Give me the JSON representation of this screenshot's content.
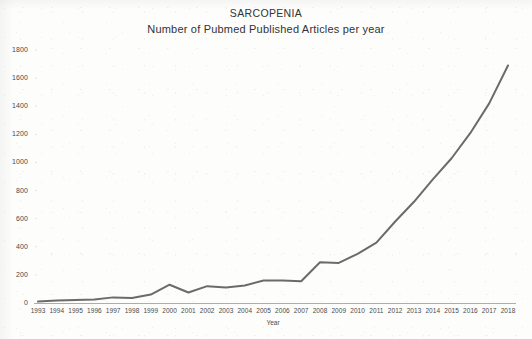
{
  "chart_data": {
    "type": "line",
    "title": "SARCOPENIA",
    "subtitle": "Number of Pubmed Published Articles per year",
    "xlabel": "Year",
    "ylabel": "",
    "categories": [
      "1993",
      "1994",
      "1995",
      "1996",
      "1997",
      "1998",
      "1999",
      "2000",
      "2001",
      "2002",
      "2003",
      "2004",
      "2005",
      "2006",
      "2007",
      "2008",
      "2009",
      "2010",
      "2011",
      "2012",
      "2013",
      "2014",
      "2015",
      "2016",
      "2017",
      "2018"
    ],
    "values": [
      10,
      18,
      22,
      25,
      40,
      35,
      60,
      130,
      75,
      120,
      110,
      125,
      160,
      160,
      155,
      290,
      285,
      350,
      430,
      580,
      720,
      880,
      1030,
      1210,
      1420,
      1690
    ],
    "series": [
      {
        "name": "Pubmed published articles",
        "values": [
          10,
          18,
          22,
          25,
          40,
          35,
          60,
          130,
          75,
          120,
          110,
          125,
          160,
          160,
          155,
          290,
          285,
          350,
          430,
          580,
          720,
          880,
          1030,
          1210,
          1420,
          1690
        ]
      }
    ],
    "yticks": [
      0,
      200,
      400,
      600,
      800,
      1000,
      1200,
      1400,
      1600,
      1800
    ],
    "ylim": [
      0,
      1800
    ],
    "xlim": [
      "1993",
      "2018"
    ],
    "grid": false,
    "legend": false,
    "line_color": "#6b6b6b",
    "line_width": 2,
    "markers": false,
    "background_color": "#fdfdfc",
    "axis_color": "#8a8a8a",
    "text_color": "#3a3a3a"
  }
}
